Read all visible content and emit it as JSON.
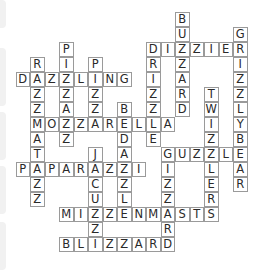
{
  "puzzle": {
    "type": "crossword-solution",
    "grid_origin": {
      "x": 15.5,
      "y": 12,
      "cell_w": 14.5,
      "cell_h": 15
    },
    "words": [
      {
        "word": "BUZZARD",
        "dir": "down",
        "row": 0,
        "col": 11
      },
      {
        "word": "GRIZZLYBEAR",
        "dir": "down",
        "row": 1,
        "col": 15
      },
      {
        "word": "DIZZIER",
        "dir": "across",
        "row": 2,
        "col": 9
      },
      {
        "word": "PIZZAZZ",
        "dir": "down",
        "row": 2,
        "col": 3
      },
      {
        "word": "DRIZZLE",
        "dir": "down",
        "row": 2,
        "col": 9
      },
      {
        "word": "RAZZMATAZZ",
        "dir": "down",
        "row": 3,
        "col": 1
      },
      {
        "word": "PIZZA",
        "dir": "down",
        "row": 3,
        "col": 5
      },
      {
        "word": "DAZZLING",
        "dir": "across",
        "row": 4,
        "col": 0
      },
      {
        "word": "TWIZZLERS",
        "dir": "down",
        "row": 5,
        "col": 13
      },
      {
        "word": "BEDAZZLE",
        "dir": "down",
        "row": 6,
        "col": 7
      },
      {
        "word": "MOZZARELLA",
        "dir": "across",
        "row": 7,
        "col": 1
      },
      {
        "word": "JACUZZI",
        "dir": "down",
        "row": 9,
        "col": 5
      },
      {
        "word": "GUZZLE",
        "dir": "across",
        "row": 9,
        "col": 10
      },
      {
        "word": "GIZZARD",
        "dir": "down",
        "row": 9,
        "col": 10
      },
      {
        "word": "PAPARAZZI",
        "dir": "across",
        "row": 10,
        "col": 0
      },
      {
        "word": "MIZZENMASTS",
        "dir": "across",
        "row": 13,
        "col": 3
      },
      {
        "word": "BLIZZARD",
        "dir": "across",
        "row": 15,
        "col": 3
      }
    ]
  },
  "colors": {
    "border": "#9a9a9a",
    "text": "#2a2a2a",
    "background": "#ffffff"
  }
}
